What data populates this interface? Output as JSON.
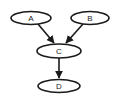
{
  "diagram": {
    "type": "directed-graph",
    "colors": {
      "stroke": "#1a1a1a",
      "fill": "#ffffff",
      "text": "#222222"
    },
    "nodes": [
      {
        "id": "A",
        "label": "A",
        "cx": 31,
        "cy": 18,
        "rx": 20,
        "ry": 6.5
      },
      {
        "id": "B",
        "label": "B",
        "cx": 90,
        "cy": 18,
        "rx": 19,
        "ry": 6.5
      },
      {
        "id": "C",
        "label": "C",
        "cx": 59,
        "cy": 51,
        "rx": 22,
        "ry": 7
      },
      {
        "id": "D",
        "label": "D",
        "cx": 59,
        "cy": 86,
        "rx": 21,
        "ry": 6.5
      }
    ],
    "edges": [
      {
        "from": "A",
        "to": "C"
      },
      {
        "from": "B",
        "to": "C"
      },
      {
        "from": "C",
        "to": "D"
      }
    ]
  }
}
